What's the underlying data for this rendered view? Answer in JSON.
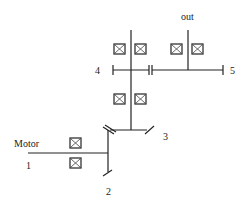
{
  "diagram": {
    "type": "gear-train-schematic",
    "labels": {
      "motor": "Motor",
      "out": "out",
      "gear1": "1",
      "gear2": "2",
      "gear3": "3",
      "gear4": "4",
      "gear5": "5"
    },
    "colors": {
      "line": "#222222",
      "background": "#ffffff"
    },
    "bearings": [
      {
        "x": 70,
        "y": 138
      },
      {
        "x": 70,
        "y": 158
      },
      {
        "x": 114,
        "y": 94
      },
      {
        "x": 135,
        "y": 94
      },
      {
        "x": 114,
        "y": 44
      },
      {
        "x": 135,
        "y": 44
      },
      {
        "x": 171,
        "y": 44
      },
      {
        "x": 192,
        "y": 44
      }
    ]
  }
}
